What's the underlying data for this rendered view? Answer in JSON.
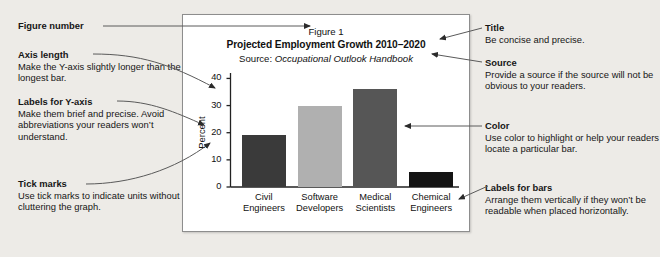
{
  "background_color": "#edebe7",
  "card": {
    "background": "#ffffff",
    "border_color": "#8d8d8d",
    "figure_number": "Figure 1",
    "title": "Projected Employment Growth 2010–2020",
    "source_prefix": "Source: ",
    "source_title": "Occupational Outlook Handbook"
  },
  "chart_data": {
    "type": "bar",
    "title": "Projected Employment Growth 2010–2020",
    "subtitle": "Source: Occupational Outlook Handbook",
    "figure_number": "Figure 1",
    "categories": [
      "Civil Engineers",
      "Software Developers",
      "Medical Scientists",
      "Chemical Engineers"
    ],
    "category_lines": [
      [
        "Civil",
        "Engineers"
      ],
      [
        "Software",
        "Developers"
      ],
      [
        "Medical",
        "Scientists"
      ],
      [
        "Chemical",
        "Engineers"
      ]
    ],
    "values": [
      19,
      30,
      36,
      5.5
    ],
    "bar_colors": [
      "#3a3a3a",
      "#b0b0b0",
      "#565656",
      "#141414"
    ],
    "xlabel": "",
    "ylabel": "Percent",
    "ylim": [
      0,
      42
    ],
    "yticks": [
      0,
      10,
      20,
      30,
      40
    ],
    "ytick_labels": [
      "0",
      "10",
      "20",
      "30",
      "40"
    ],
    "grid": false,
    "legend": "none",
    "axis_color": "#222222"
  },
  "annotations_left": [
    {
      "id": "figure-number",
      "heading": "Figure number",
      "body": ""
    },
    {
      "id": "axis-length",
      "heading": "Axis length",
      "body": "Make the Y-axis slightly longer than the longest bar."
    },
    {
      "id": "labels-for-y-axis",
      "heading": "Labels for Y-axis",
      "body": "Make them brief and precise. Avoid abbreviations your readers won’t understand."
    },
    {
      "id": "tick-marks",
      "heading": "Tick marks",
      "body": "Use tick marks to indicate units without cluttering the graph."
    }
  ],
  "annotations_right": [
    {
      "id": "title",
      "heading": "Title",
      "body": "Be concise and precise."
    },
    {
      "id": "source",
      "heading": "Source",
      "body": "Provide a source if the source will not be obvious to your readers."
    },
    {
      "id": "color",
      "heading": "Color",
      "body": "Use color to highlight or help your readers locate a particular bar."
    },
    {
      "id": "labels-for-bars",
      "heading": "Labels for bars",
      "body": "Arrange them vertically if they won’t be readable when placed horizontally."
    }
  ]
}
